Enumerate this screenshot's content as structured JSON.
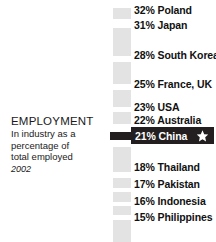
{
  "caption": {
    "title": "EMPLOYMENT",
    "lines": [
      "In industry as a",
      "percentage of",
      "total employed"
    ],
    "year": "2002"
  },
  "highlight": {
    "label": "21% China",
    "value": 21,
    "country": "China",
    "star_icon": "star-icon",
    "bar_color": "#231f20",
    "text_color": "#ffffff"
  },
  "segment_color": "#e3e3e3",
  "rows": [
    {
      "label": "32% Poland",
      "value": 32,
      "country": "Poland",
      "top": 4
    },
    {
      "label": "31% Japan",
      "value": 31,
      "country": "Japan",
      "top": 19
    },
    {
      "label": "28% South Korea",
      "value": 28,
      "country": "South Korea",
      "top": 49
    },
    {
      "label": "25% France, UK",
      "value": 25,
      "country": "France, UK",
      "top": 78
    },
    {
      "label": "23% USA",
      "value": 23,
      "country": "USA",
      "top": 101
    },
    {
      "label": "22% Australia",
      "value": 22,
      "country": "Australia",
      "top": 114
    },
    {
      "label": "18% Thailand",
      "value": 18,
      "country": "Thailand",
      "top": 161
    },
    {
      "label": "17% Pakistan",
      "value": 17,
      "country": "Pakistan",
      "top": 178
    },
    {
      "label": "16% Indonesia",
      "value": 16,
      "country": "Indonesia",
      "top": 195
    },
    {
      "label": "15% Philippines",
      "value": 15,
      "country": "Philippines",
      "top": 211
    }
  ],
  "segments": [
    {
      "top": 8,
      "height": 11
    },
    {
      "top": 28,
      "height": 28
    },
    {
      "top": 62,
      "height": 22
    },
    {
      "top": 90,
      "height": 17
    },
    {
      "top": 112,
      "height": 12
    },
    {
      "top": 147,
      "height": 25
    },
    {
      "top": 178,
      "height": 10
    },
    {
      "top": 192,
      "height": 10
    },
    {
      "top": 206,
      "height": 9
    },
    {
      "top": 220,
      "height": 22
    }
  ],
  "chart_data": {
    "type": "bar",
    "title": "EMPLOYMENT",
    "subtitle": "In industry as a percentage of total employed",
    "year": "2002",
    "xlabel": "",
    "ylabel": "Percentage of total employed",
    "unit": "%",
    "categories": [
      "Poland",
      "Japan",
      "South Korea",
      "France, UK",
      "USA",
      "Australia",
      "China",
      "Thailand",
      "Pakistan",
      "Indonesia",
      "Philippines"
    ],
    "values": [
      32,
      31,
      28,
      25,
      23,
      22,
      21,
      18,
      17,
      16,
      15
    ],
    "highlighted": "China",
    "ylim": [
      15,
      32
    ],
    "grid": false,
    "legend": "none",
    "orientation": "vertical-scale"
  }
}
